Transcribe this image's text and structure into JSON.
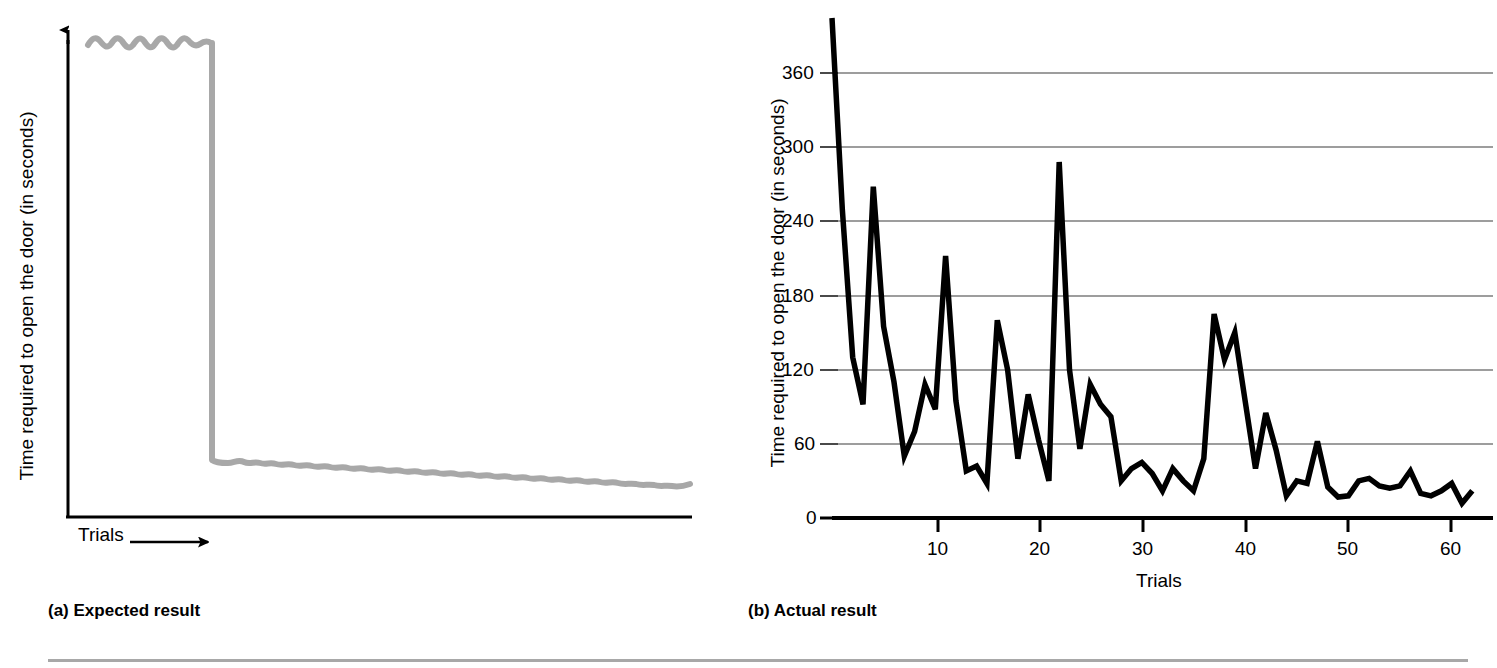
{
  "figure": {
    "panels": [
      {
        "id": "a",
        "caption": "(a) Expected result",
        "ylabel": "Time required to open the door (in seconds)",
        "xlabel": "Trials",
        "xarrow": "right-arrow-icon"
      },
      {
        "id": "b",
        "caption": "(b) Actual result",
        "ylabel": "Time required to open the door (in seconds)",
        "xlabel": "Trials"
      }
    ],
    "rule_color": "#a8a8a8"
  },
  "chart_data": [
    {
      "type": "line",
      "panel": "a",
      "title": "(a) Expected result",
      "xlabel": "Trials",
      "ylabel": "Time required to open the door (in seconds)",
      "xticklabels": [],
      "yticklabels": [],
      "grid": false,
      "legend": false,
      "line_color": "#a8a8a8",
      "description": "Idealized insight learning curve: a high, slightly wavy plateau for the first several trials, then an abrupt vertical drop to a low, nearly flat plateau that slowly declines across the remaining trials.",
      "x": [
        0,
        1,
        2,
        3,
        4,
        5,
        6,
        7,
        8,
        9,
        10,
        11,
        12,
        13,
        14,
        15,
        16,
        17,
        18,
        19,
        20,
        21,
        22,
        23,
        24,
        25,
        26,
        27,
        28,
        29,
        30,
        31,
        32,
        33,
        34,
        35,
        36,
        37,
        38,
        39,
        40,
        41,
        42,
        43,
        44,
        45,
        46,
        47,
        48,
        49,
        50
      ],
      "values": [
        95,
        99,
        93,
        100,
        94,
        99,
        93,
        100,
        94,
        99,
        94,
        98,
        95,
        22,
        21,
        22,
        20,
        22,
        20,
        22,
        20,
        21,
        20,
        21,
        19,
        21,
        19,
        21,
        19,
        20,
        18,
        20,
        18,
        20,
        18,
        19,
        17,
        19,
        17,
        19,
        17,
        18,
        16,
        18,
        16,
        17,
        15,
        17,
        15,
        16,
        15
      ],
      "ylim": [
        0,
        110
      ],
      "drop_at_x": 13
    },
    {
      "type": "line",
      "panel": "b",
      "title": "(b) Actual result",
      "xlabel": "Trials",
      "ylabel": "Time required to open the door (in seconds)",
      "xticklabels": [
        "10",
        "20",
        "30",
        "40",
        "50",
        "60"
      ],
      "xticks": [
        10,
        20,
        30,
        40,
        50,
        60
      ],
      "yticklabels": [
        "0",
        "60",
        "120",
        "180",
        "240",
        "300",
        "360"
      ],
      "yticks": [
        0,
        60,
        120,
        180,
        240,
        300,
        360
      ],
      "xlim": [
        1,
        65
      ],
      "ylim": [
        0,
        390
      ],
      "grid": true,
      "grid_color": "#808080",
      "legend": false,
      "line_color": "#000000",
      "description": "Trial-and-error learning curve with very high and erratic times on early trials, large spikes through trial 22, and a gradual decline to short, stable times after trial 45.",
      "x": [
        1,
        2,
        3,
        4,
        5,
        6,
        7,
        8,
        9,
        10,
        11,
        12,
        13,
        14,
        15,
        16,
        17,
        18,
        19,
        20,
        21,
        22,
        23,
        24,
        25,
        26,
        27,
        28,
        29,
        30,
        31,
        32,
        33,
        34,
        35,
        36,
        37,
        38,
        39,
        40,
        41,
        42,
        43,
        44,
        45,
        46,
        47,
        48,
        49,
        50,
        51,
        52,
        53,
        54,
        55,
        56,
        57,
        58,
        59,
        60,
        61,
        62,
        63
      ],
      "values": [
        420,
        250,
        130,
        92,
        268,
        155,
        110,
        50,
        70,
        108,
        88,
        212,
        95,
        38,
        42,
        28,
        160,
        120,
        48,
        100,
        63,
        30,
        288,
        120,
        56,
        108,
        92,
        82,
        30,
        40,
        45,
        36,
        22,
        40,
        30,
        22,
        48,
        165,
        128,
        150,
        95,
        40,
        85,
        55,
        18,
        30,
        28,
        62,
        25,
        17,
        18,
        30,
        32,
        26,
        24,
        26,
        38,
        20,
        18,
        22,
        28,
        12,
        22
      ]
    }
  ]
}
